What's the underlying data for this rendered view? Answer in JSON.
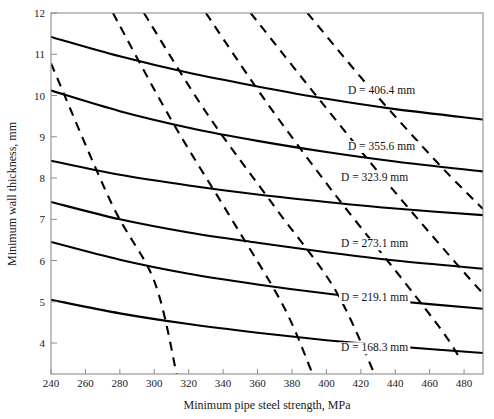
{
  "chart_data": {
    "type": "line",
    "title": "",
    "xlabel": "Minimum pipe steel strength, MPa",
    "ylabel": "Minimum wall thickness, mm",
    "xlim": [
      240,
      491
    ],
    "ylim": [
      3.25,
      12
    ],
    "xticks": [
      240,
      260,
      280,
      300,
      320,
      340,
      360,
      380,
      400,
      420,
      440,
      460,
      480
    ],
    "yticks": [
      4,
      5,
      6,
      7,
      8,
      9,
      10,
      11,
      12
    ],
    "grid": false,
    "legend_position": "inline-labels",
    "series": [
      {
        "name": "D = 406.4 mm",
        "style": "solid",
        "label": "D = 406.4 mm",
        "label_x": 432,
        "label_y": 10.05,
        "points": [
          {
            "x": 240,
            "y": 11.42
          },
          {
            "x": 280,
            "y": 10.95
          },
          {
            "x": 320,
            "y": 10.55
          },
          {
            "x": 360,
            "y": 10.22
          },
          {
            "x": 400,
            "y": 9.92
          },
          {
            "x": 440,
            "y": 9.67
          },
          {
            "x": 491,
            "y": 9.42
          }
        ]
      },
      {
        "name": "D = 355.6 mm",
        "style": "solid",
        "label": "D = 355.6 mm",
        "label_x": 432,
        "label_y": 8.68,
        "points": [
          {
            "x": 240,
            "y": 10.12
          },
          {
            "x": 280,
            "y": 9.62
          },
          {
            "x": 320,
            "y": 9.22
          },
          {
            "x": 360,
            "y": 8.9
          },
          {
            "x": 400,
            "y": 8.63
          },
          {
            "x": 440,
            "y": 8.4
          },
          {
            "x": 491,
            "y": 8.16
          }
        ]
      },
      {
        "name": "D = 323.9 mm",
        "style": "solid",
        "label": "D = 323.9 mm",
        "label_x": 428,
        "label_y": 7.94,
        "points": [
          {
            "x": 240,
            "y": 8.42
          },
          {
            "x": 280,
            "y": 8.08
          },
          {
            "x": 320,
            "y": 7.82
          },
          {
            "x": 360,
            "y": 7.6
          },
          {
            "x": 400,
            "y": 7.42
          },
          {
            "x": 440,
            "y": 7.26
          },
          {
            "x": 491,
            "y": 7.1
          }
        ]
      },
      {
        "name": "D = 273.1 mm",
        "style": "solid",
        "label": "D = 273.1 mm",
        "label_x": 428,
        "label_y": 6.32,
        "points": [
          {
            "x": 240,
            "y": 7.42
          },
          {
            "x": 280,
            "y": 7.0
          },
          {
            "x": 320,
            "y": 6.68
          },
          {
            "x": 360,
            "y": 6.43
          },
          {
            "x": 400,
            "y": 6.2
          },
          {
            "x": 440,
            "y": 6.0
          },
          {
            "x": 491,
            "y": 5.8
          }
        ]
      },
      {
        "name": "D = 219.1 mm",
        "style": "solid",
        "label": "D = 219.1 mm",
        "label_x": 428,
        "label_y": 5.02,
        "points": [
          {
            "x": 240,
            "y": 6.45
          },
          {
            "x": 280,
            "y": 6.02
          },
          {
            "x": 320,
            "y": 5.68
          },
          {
            "x": 360,
            "y": 5.42
          },
          {
            "x": 400,
            "y": 5.2
          },
          {
            "x": 440,
            "y": 5.02
          },
          {
            "x": 491,
            "y": 4.83
          }
        ]
      },
      {
        "name": "D = 168.3 mm",
        "style": "solid",
        "label": "D = 168.3 mm",
        "label_x": 428,
        "label_y": 3.8,
        "points": [
          {
            "x": 240,
            "y": 5.05
          },
          {
            "x": 280,
            "y": 4.72
          },
          {
            "x": 320,
            "y": 4.46
          },
          {
            "x": 360,
            "y": 4.25
          },
          {
            "x": 400,
            "y": 4.07
          },
          {
            "x": 440,
            "y": 3.92
          },
          {
            "x": 491,
            "y": 3.76
          }
        ]
      },
      {
        "name": "dashed-1",
        "style": "dashed",
        "label": "",
        "points": [
          {
            "x": 240,
            "y": 10.78
          },
          {
            "x": 275,
            "y": 7.4
          },
          {
            "x": 300,
            "y": 5.5
          },
          {
            "x": 313,
            "y": 3.25
          }
        ]
      },
      {
        "name": "dashed-2",
        "style": "dashed",
        "label": "",
        "points": [
          {
            "x": 276,
            "y": 12.0
          },
          {
            "x": 310,
            "y": 9.4
          },
          {
            "x": 345,
            "y": 7.0
          },
          {
            "x": 375,
            "y": 4.9
          },
          {
            "x": 392,
            "y": 3.25
          }
        ]
      },
      {
        "name": "dashed-3",
        "style": "dashed",
        "label": "",
        "points": [
          {
            "x": 294,
            "y": 12.0
          },
          {
            "x": 330,
            "y": 9.6
          },
          {
            "x": 370,
            "y": 7.3
          },
          {
            "x": 405,
            "y": 5.3
          },
          {
            "x": 428,
            "y": 3.25
          }
        ]
      },
      {
        "name": "dashed-4",
        "style": "dashed",
        "label": "",
        "points": [
          {
            "x": 330,
            "y": 12.0
          },
          {
            "x": 365,
            "y": 9.85
          },
          {
            "x": 405,
            "y": 7.6
          },
          {
            "x": 445,
            "y": 5.5
          },
          {
            "x": 468,
            "y": 4.25
          },
          {
            "x": 478,
            "y": 3.6
          }
        ]
      },
      {
        "name": "dashed-5",
        "style": "dashed",
        "label": "",
        "points": [
          {
            "x": 356,
            "y": 12.0
          },
          {
            "x": 395,
            "y": 9.95
          },
          {
            "x": 435,
            "y": 7.9
          },
          {
            "x": 475,
            "y": 5.95
          },
          {
            "x": 491,
            "y": 5.2
          }
        ]
      },
      {
        "name": "dashed-6",
        "style": "dashed",
        "label": "",
        "points": [
          {
            "x": 389,
            "y": 12.0
          },
          {
            "x": 425,
            "y": 10.2
          },
          {
            "x": 465,
            "y": 8.35
          },
          {
            "x": 491,
            "y": 7.25
          }
        ]
      }
    ]
  },
  "colors": {
    "background": "#ffffff",
    "frame": "#8c8c8c",
    "curve": "#000000",
    "text": "#1a1a1a"
  }
}
